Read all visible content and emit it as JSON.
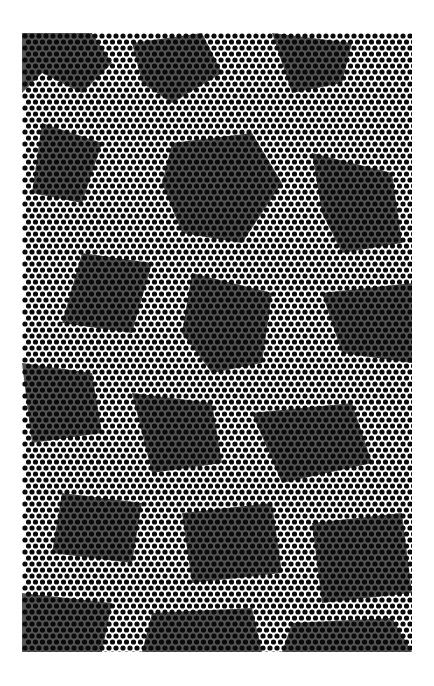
{
  "image": {
    "caption": "Abstract halftone dot pattern",
    "frame": {
      "x": 22,
      "y": 33,
      "width": 390,
      "height": 619
    },
    "colors": {
      "background": "#ffffff",
      "dot": "#0a0a0a",
      "shade": "#555555"
    },
    "dot_grid": {
      "pitch_x": 7,
      "pitch_y": 6,
      "radius": 2.6,
      "row_offset": 3.5
    },
    "shade_regions": [
      "M0,0 L70,0 L90,30 L60,60 L20,40 L0,60 Z",
      "M110,10 L180,0 L200,40 L150,70 L120,50 Z",
      "M250,0 L330,10 L320,50 L270,60 Z",
      "M20,90 L80,110 L60,170 L10,160 Z",
      "M150,110 L230,100 L260,150 L220,210 L160,200 L140,150 Z",
      "M290,120 L370,140 L380,210 L320,220 L300,180 Z",
      "M60,220 L130,230 L110,300 L40,290 Z",
      "M170,240 L250,260 L240,330 L190,340 L160,300 Z",
      "M300,260 L390,250 L390,330 L320,320 Z",
      "M0,330 L70,340 L80,400 L10,410 Z",
      "M110,360 L190,370 L200,430 L130,440 Z",
      "M230,380 L330,370 L350,430 L260,450 Z",
      "M40,460 L120,470 L110,530 L30,520 Z",
      "M160,480 L250,470 L260,540 L170,550 Z",
      "M290,490 L380,480 L390,560 L300,570 Z",
      "M0,560 L90,570 L80,619 L0,619 Z",
      "M130,580 L230,575 L240,619 L120,619 Z",
      "M270,590 L370,585 L390,619 L260,619 Z"
    ]
  }
}
